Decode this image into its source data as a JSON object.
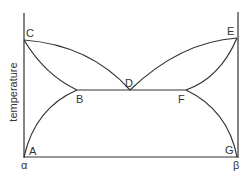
{
  "diagram": {
    "type": "binary phase diagram (eutectic)",
    "y_axis_label": "temperature",
    "x_axis_left_label": "α",
    "x_axis_right_label": "β",
    "points": {
      "A": "A",
      "B": "B",
      "C": "C",
      "D": "D",
      "E": "E",
      "F": "F",
      "G": "G"
    },
    "line_color": "#333333"
  }
}
